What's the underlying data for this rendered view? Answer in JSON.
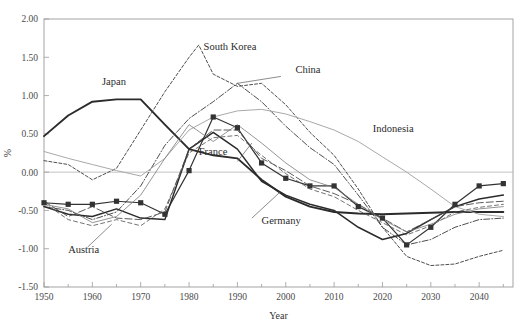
{
  "chart_data": {
    "type": "line",
    "title": "",
    "xlabel": "Year",
    "ylabel": "%",
    "xlim": [
      1950,
      2047
    ],
    "ylim": [
      -1.5,
      2.0
    ],
    "grid": false,
    "legend": "inline-labels",
    "x_ticks_major": [
      1950,
      1960,
      1970,
      1980,
      1990,
      2000,
      2010,
      2020,
      2030,
      2040
    ],
    "x_ticks_minor": [
      1955,
      1965,
      1975,
      1985,
      1995,
      2005,
      2015,
      2025,
      2035,
      2045
    ],
    "y_ticks": [
      -1.5,
      -1.0,
      -0.5,
      0.0,
      0.5,
      1.0,
      1.5,
      2.0
    ],
    "y_tick_labels": [
      "-1.50",
      "-1.00",
      "-0.50",
      "0.00",
      "0.50",
      "1.00",
      "1.50",
      "2.00"
    ],
    "x_tick_labels": [
      "1950",
      "1960",
      "1970",
      "1980",
      "1990",
      "2000",
      "2010",
      "2020",
      "2030",
      "2040"
    ],
    "zero_reference_line": 0.0,
    "series": [
      {
        "name": "Japan",
        "style": "solid-thick",
        "color": "#2b2b2b",
        "width": 1.9,
        "markers": "none",
        "label_x": 1962,
        "label_y": 1.14,
        "x": [
          1950,
          1955,
          1960,
          1965,
          1970,
          1975,
          1980,
          1985,
          1990,
          1995,
          2000,
          2005,
          2010,
          2015,
          2020,
          2025,
          2030,
          2035,
          2040,
          2045
        ],
        "values": [
          0.47,
          0.74,
          0.92,
          0.95,
          0.95,
          0.62,
          0.3,
          0.22,
          0.18,
          -0.1,
          -0.32,
          -0.45,
          -0.52,
          -0.54,
          -0.55,
          -0.54,
          -0.53,
          -0.52,
          -0.52,
          -0.52
        ]
      },
      {
        "name": "South Korea",
        "style": "dashed-fine",
        "color": "#3a3a3a",
        "width": 0.9,
        "dash": "3,2",
        "markers": "none",
        "label_x": 1983,
        "label_y": 1.6,
        "x": [
          1950,
          1955,
          1960,
          1965,
          1970,
          1975,
          1980,
          1982,
          1985,
          1990,
          1995,
          2000,
          2005,
          2010,
          2015,
          2020,
          2025,
          2030,
          2035,
          2040,
          2045
        ],
        "values": [
          0.15,
          0.1,
          -0.1,
          0.05,
          0.55,
          1.05,
          1.5,
          1.66,
          1.28,
          1.12,
          1.16,
          0.88,
          0.52,
          0.22,
          -0.22,
          -0.72,
          -1.1,
          -1.22,
          -1.2,
          -1.1,
          -1.02
        ]
      },
      {
        "name": "China",
        "style": "dash-dot",
        "color": "#3a3a3a",
        "width": 0.9,
        "dash": "6,2,1,2",
        "markers": "none",
        "label_x": 2002,
        "label_y": 1.3,
        "leader_from_x": 1999,
        "leader_from_y": 1.25,
        "leader_to_x": 1990,
        "leader_to_y": 1.16,
        "x": [
          1950,
          1955,
          1960,
          1965,
          1970,
          1975,
          1980,
          1985,
          1990,
          1995,
          2000,
          2005,
          2010,
          2015,
          2020,
          2025,
          2030,
          2035,
          2040,
          2045
        ],
        "values": [
          -0.45,
          -0.5,
          -0.62,
          -0.52,
          -0.18,
          0.35,
          0.7,
          0.92,
          1.16,
          0.92,
          0.6,
          0.32,
          0.1,
          -0.3,
          -0.72,
          -0.95,
          -0.88,
          -0.72,
          -0.62,
          -0.6
        ]
      },
      {
        "name": "Indonesia",
        "style": "solid-light",
        "color": "#a9a9a9",
        "width": 1.0,
        "markers": "none",
        "label_x": 2018,
        "label_y": 0.52,
        "x": [
          1950,
          1955,
          1960,
          1965,
          1970,
          1975,
          1980,
          1985,
          1990,
          1995,
          2000,
          2005,
          2010,
          2015,
          2020,
          2025,
          2030,
          2035,
          2040,
          2045
        ],
        "values": [
          0.27,
          0.18,
          0.1,
          0.02,
          -0.05,
          0.18,
          0.55,
          0.72,
          0.8,
          0.82,
          0.76,
          0.66,
          0.55,
          0.4,
          0.2,
          0.0,
          -0.22,
          -0.45,
          -0.55,
          -0.58
        ]
      },
      {
        "name": "France",
        "style": "solid-marker",
        "color": "#333333",
        "width": 1.2,
        "markers": "square",
        "label_x": 1982,
        "label_y": 0.22,
        "leader_from_x": 1990,
        "leader_from_y": 0.14,
        "leader_to_x": 1993,
        "leader_to_y": 0.38,
        "x": [
          1950,
          1955,
          1960,
          1965,
          1970,
          1975,
          1980,
          1985,
          1990,
          1995,
          2000,
          2005,
          2010,
          2015,
          2020,
          2025,
          2030,
          2035,
          2040,
          2045
        ],
        "values": [
          -0.4,
          -0.42,
          -0.42,
          -0.38,
          -0.4,
          -0.55,
          0.02,
          0.72,
          0.58,
          0.12,
          -0.08,
          -0.18,
          -0.18,
          -0.45,
          -0.6,
          -0.95,
          -0.72,
          -0.42,
          -0.18,
          -0.15
        ]
      },
      {
        "name": "Germany",
        "style": "solid-medium",
        "color": "#2b2b2b",
        "width": 1.5,
        "markers": "none",
        "label_x": 1995,
        "label_y": -0.68,
        "leader_from_x": 1993,
        "leader_from_y": -0.6,
        "leader_to_x": 1999,
        "leader_to_y": -0.25,
        "x": [
          1950,
          1955,
          1960,
          1965,
          1970,
          1975,
          1980,
          1985,
          1990,
          1995,
          2000,
          2005,
          2010,
          2015,
          2020,
          2025,
          2030,
          2035,
          2040,
          2045
        ],
        "values": [
          -0.45,
          -0.55,
          -0.58,
          -0.48,
          -0.6,
          -0.62,
          0.3,
          0.52,
          0.3,
          -0.12,
          -0.3,
          -0.42,
          -0.5,
          -0.72,
          -0.88,
          -0.8,
          -0.62,
          -0.45,
          -0.35,
          -0.3
        ]
      },
      {
        "name": "Austria",
        "style": "dashed-long",
        "color": "#4a4a4a",
        "width": 0.9,
        "dash": "7,3",
        "markers": "none",
        "label_x": 1955,
        "label_y": -1.06,
        "leader_from_x": 1959,
        "leader_from_y": -0.98,
        "leader_to_x": 1964,
        "leader_to_y": -0.68,
        "x": [
          1950,
          1955,
          1960,
          1965,
          1970,
          1975,
          1980,
          1985,
          1990,
          1995,
          2000,
          2005,
          2010,
          2015,
          2020,
          2025,
          2030,
          2035,
          2040,
          2045
        ],
        "values": [
          -0.38,
          -0.58,
          -0.45,
          -0.6,
          -0.62,
          -0.52,
          0.3,
          0.55,
          0.55,
          0.18,
          0.02,
          -0.18,
          -0.28,
          -0.42,
          -0.6,
          -0.78,
          -0.62,
          -0.45,
          -0.4,
          -0.38
        ]
      },
      {
        "name": "Series-H",
        "style": "dashed-mid",
        "color": "#5a5a5a",
        "width": 0.85,
        "dash": "4,3",
        "markers": "none",
        "x": [
          1950,
          1955,
          1960,
          1965,
          1970,
          1975,
          1980,
          1985,
          1990,
          1995,
          2000,
          2005,
          2010,
          2015,
          2020,
          2025,
          2030,
          2035,
          2040,
          2045
        ],
        "values": [
          -0.4,
          -0.62,
          -0.7,
          -0.62,
          -0.7,
          -0.48,
          0.25,
          0.45,
          0.48,
          0.22,
          -0.02,
          -0.22,
          -0.32,
          -0.5,
          -0.66,
          -0.82,
          -0.7,
          -0.52,
          -0.46,
          -0.42
        ]
      },
      {
        "name": "Series-I",
        "style": "solid-thin",
        "color": "#7a7a7a",
        "width": 0.8,
        "markers": "none",
        "x": [
          1950,
          1955,
          1960,
          1965,
          1970,
          1975,
          1980,
          1985,
          1990,
          1995,
          2000,
          2005,
          2010,
          2015,
          2020,
          2025,
          2030,
          2035,
          2040,
          2045
        ],
        "values": [
          -0.42,
          -0.48,
          -0.66,
          -0.58,
          -0.3,
          0.18,
          0.62,
          0.4,
          0.62,
          0.38,
          0.12,
          -0.1,
          -0.2,
          -0.42,
          -0.62,
          -0.78,
          -0.68,
          -0.55,
          -0.48,
          -0.45
        ]
      }
    ],
    "annotations": [
      {
        "text": "South Korea",
        "x": 1983,
        "y": 1.6
      },
      {
        "text": "China",
        "x": 2002,
        "y": 1.3
      },
      {
        "text": "Japan",
        "x": 1962,
        "y": 1.14
      },
      {
        "text": "Indonesia",
        "x": 2018,
        "y": 0.52
      },
      {
        "text": "France",
        "x": 1982,
        "y": 0.22
      },
      {
        "text": "Germany",
        "x": 1995,
        "y": -0.68
      },
      {
        "text": "Austria",
        "x": 1955,
        "y": -1.06
      }
    ]
  }
}
